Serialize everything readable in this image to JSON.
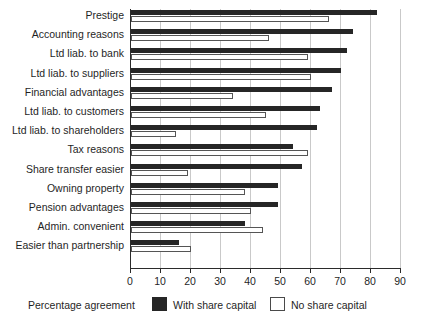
{
  "chart_data": {
    "type": "bar",
    "orientation": "horizontal",
    "title": "",
    "xlabel": "Percentage agreement",
    "ylabel": "",
    "xlim": [
      0,
      90
    ],
    "xticks": [
      0,
      10,
      20,
      30,
      40,
      50,
      60,
      70,
      80,
      90
    ],
    "tick_labels": [
      "0",
      "10",
      "20",
      "30",
      "40",
      "50",
      "60",
      "70",
      "80",
      "90"
    ],
    "grid": true,
    "legend_position": "bottom",
    "categories": [
      "Prestige",
      "Accounting reasons",
      "Ltd liab. to bank",
      "Ltd liab. to suppliers",
      "Financial advantages",
      "Ltd liab. to customers",
      "Ltd liab. to shareholders",
      "Tax reasons",
      "Share transfer easier",
      "Owning property",
      "Pension advantages",
      "Admin. convenient",
      "Easier than partnership"
    ],
    "series": [
      {
        "name": "With share capital",
        "color": "#262626",
        "values": [
          82,
          74,
          72,
          70,
          67,
          63,
          62,
          54,
          57,
          49,
          49,
          38,
          16
        ]
      },
      {
        "name": "No share capital",
        "color": "#ffffff",
        "values": [
          66,
          46,
          59,
          60,
          34,
          45,
          15,
          59,
          19,
          38,
          40,
          44,
          20
        ]
      }
    ]
  },
  "legend": {
    "axis_title": "Percentage agreement",
    "entries": [
      {
        "label": "With share capital",
        "swatch": "dark"
      },
      {
        "label": "No share capital",
        "swatch": "light"
      }
    ]
  }
}
